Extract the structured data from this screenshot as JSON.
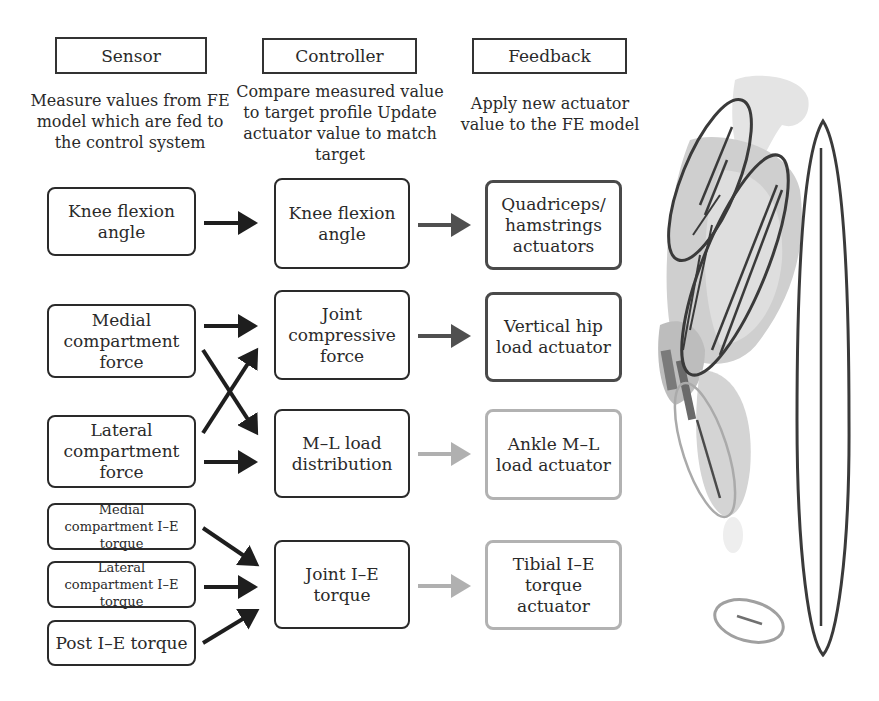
{
  "columns": {
    "sensor": {
      "title": "Sensor",
      "description": "Measure values from FE model which are fed to the control system"
    },
    "controller": {
      "title": "Controller",
      "description": "Compare measured value to target profile Update actuator value to match target"
    },
    "feedback": {
      "title": "Feedback",
      "description": "Apply new actuator value to the FE model"
    }
  },
  "sensors": [
    {
      "label": "Knee flexion angle"
    },
    {
      "label": "Medial compartment force"
    },
    {
      "label": "Lateral compartment force"
    },
    {
      "label": "Medial compartment I–E torque"
    },
    {
      "label": "Lateral compartment I–E torque"
    },
    {
      "label": "Post I–E torque"
    }
  ],
  "controllers": [
    {
      "label": "Knee flexion angle"
    },
    {
      "label": "Joint compressive force"
    },
    {
      "label": "M–L load distribution"
    },
    {
      "label": "Joint I–E torque"
    }
  ],
  "feedback": [
    {
      "label": "Quadriceps/ hamstrings actuators",
      "shade": "dark"
    },
    {
      "label": "Vertical hip load actuator",
      "shade": "dark"
    },
    {
      "label": "Ankle M–L load actuator",
      "shade": "light"
    },
    {
      "label": "Tibial I–E torque actuator",
      "shade": "light"
    }
  ],
  "connections": [
    {
      "from": "Knee flexion angle (sensor)",
      "to": "Knee flexion angle (controller)"
    },
    {
      "from": "Medial compartment force",
      "to": "Joint compressive force"
    },
    {
      "from": "Medial compartment force",
      "to": "M–L load distribution"
    },
    {
      "from": "Lateral compartment force",
      "to": "Joint compressive force"
    },
    {
      "from": "Lateral compartment force",
      "to": "M–L load distribution"
    },
    {
      "from": "Medial compartment I–E torque",
      "to": "Joint I–E torque"
    },
    {
      "from": "Lateral compartment I–E torque",
      "to": "Joint I–E torque"
    },
    {
      "from": "Post I–E torque",
      "to": "Joint I–E torque"
    },
    {
      "from": "Knee flexion angle (controller)",
      "to": "Quadriceps/ hamstrings actuators"
    },
    {
      "from": "Joint compressive force",
      "to": "Vertical hip load actuator"
    },
    {
      "from": "M–L load distribution",
      "to": "Ankle M–L load actuator"
    },
    {
      "from": "Joint I–E torque",
      "to": "Tibial I–E torque actuator"
    }
  ],
  "colors": {
    "dark_stroke": "#2a2a2a",
    "feedback_dark": "#4a4a4a",
    "feedback_light": "#b2b2b2",
    "model_gray": "#c8c8c8"
  }
}
